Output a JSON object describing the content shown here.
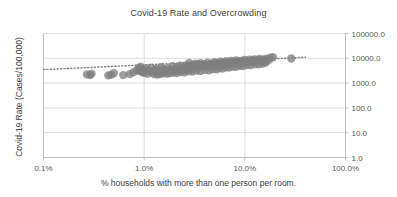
{
  "chart_data": {
    "type": "scatter",
    "title": "Covid-19 Rate and Overcrowding",
    "xlabel": "% households with more than one person per room.",
    "ylabel": "Covid-19 Rate (Cases/100,000)",
    "xscale": "log",
    "yscale": "log",
    "xlim": [
      0.1,
      100.0
    ],
    "ylim": [
      1.0,
      100000.0
    ],
    "x_tick_labels": [
      "0.1%",
      "1.0%",
      "10.0%",
      "100.0%"
    ],
    "x_tick_values": [
      0.1,
      1.0,
      10.0,
      100.0
    ],
    "y_tick_labels": [
      "100000.0",
      "10000.0",
      "1000.0",
      "100.0",
      "10.0",
      "1.0"
    ],
    "y_tick_values": [
      100000.0,
      10000.0,
      1000.0,
      100.0,
      10.0,
      1.0
    ],
    "y_axis_position": "right",
    "grid": "horizontal-and-vertical",
    "legend": "none",
    "marker_color": "#7f7f7f",
    "marker_size": 6,
    "marker_opacity": 0.75,
    "trendline": {
      "style": "dotted",
      "color": "#7f7f7f",
      "x_start": 0.1,
      "y_start": 3500,
      "x_end": 40.0,
      "y_end": 11000
    },
    "series": [
      {
        "name": "Counties",
        "points": [
          [
            0.27,
            2250
          ],
          [
            0.29,
            2100
          ],
          [
            0.3,
            2400
          ],
          [
            0.44,
            2050
          ],
          [
            0.47,
            2150
          ],
          [
            0.5,
            2500
          ],
          [
            0.62,
            2100
          ],
          [
            0.72,
            2300
          ],
          [
            0.78,
            2700
          ],
          [
            0.85,
            3300
          ],
          [
            0.88,
            4000
          ],
          [
            0.9,
            3100
          ],
          [
            0.92,
            4600
          ],
          [
            0.95,
            2800
          ],
          [
            0.97,
            3500
          ],
          [
            1.0,
            2600
          ],
          [
            1.02,
            3000
          ],
          [
            1.05,
            3900
          ],
          [
            1.08,
            2400
          ],
          [
            1.1,
            3200
          ],
          [
            1.15,
            2900
          ],
          [
            1.18,
            4200
          ],
          [
            1.22,
            2700
          ],
          [
            1.28,
            3400
          ],
          [
            1.32,
            3800
          ],
          [
            1.38,
            2500
          ],
          [
            1.42,
            3100
          ],
          [
            1.48,
            4400
          ],
          [
            1.55,
            3600
          ],
          [
            1.6,
            2800
          ],
          [
            1.65,
            3300
          ],
          [
            1.72,
            4000
          ],
          [
            1.78,
            2600
          ],
          [
            1.85,
            3500
          ],
          [
            1.92,
            4800
          ],
          [
            1.98,
            3000
          ],
          [
            2.05,
            3700
          ],
          [
            2.12,
            4300
          ],
          [
            2.2,
            3200
          ],
          [
            2.28,
            5000
          ],
          [
            2.35,
            3900
          ],
          [
            2.45,
            4500
          ],
          [
            2.55,
            3400
          ],
          [
            2.62,
            5200
          ],
          [
            2.7,
            4100
          ],
          [
            2.8,
            6500
          ],
          [
            2.88,
            4700
          ],
          [
            2.95,
            3800
          ],
          [
            3.05,
            5500
          ],
          [
            3.15,
            4300
          ],
          [
            3.25,
            6000
          ],
          [
            3.35,
            4900
          ],
          [
            3.45,
            5600
          ],
          [
            3.55,
            4200
          ],
          [
            3.65,
            6300
          ],
          [
            3.75,
            5100
          ],
          [
            3.85,
            4600
          ],
          [
            3.95,
            5800
          ],
          [
            4.1,
            5000
          ],
          [
            4.25,
            6600
          ],
          [
            4.4,
            5400
          ],
          [
            4.55,
            4800
          ],
          [
            4.7,
            6100
          ],
          [
            4.85,
            5600
          ],
          [
            5.0,
            7000
          ],
          [
            5.15,
            5200
          ],
          [
            5.3,
            6400
          ],
          [
            5.5,
            5900
          ],
          [
            5.7,
            7300
          ],
          [
            5.9,
            5500
          ],
          [
            6.1,
            6800
          ],
          [
            6.3,
            6200
          ],
          [
            6.5,
            7600
          ],
          [
            6.7,
            5800
          ],
          [
            6.9,
            7000
          ],
          [
            7.1,
            6500
          ],
          [
            7.3,
            7900
          ],
          [
            7.5,
            6100
          ],
          [
            7.7,
            7200
          ],
          [
            7.9,
            6700
          ],
          [
            8.2,
            8200
          ],
          [
            8.5,
            6900
          ],
          [
            8.8,
            7600
          ],
          [
            9.1,
            6400
          ],
          [
            9.4,
            8000
          ],
          [
            9.7,
            7200
          ],
          [
            10.0,
            8600
          ],
          [
            10.4,
            7000
          ],
          [
            10.8,
            7800
          ],
          [
            11.2,
            8800
          ],
          [
            11.6,
            7400
          ],
          [
            12.0,
            8300
          ],
          [
            12.5,
            9000
          ],
          [
            13.0,
            7700
          ],
          [
            13.5,
            8600
          ],
          [
            14.0,
            9400
          ],
          [
            14.6,
            8100
          ],
          [
            15.2,
            8900
          ],
          [
            15.8,
            7500
          ],
          [
            16.5,
            9600
          ],
          [
            17.2,
            8400
          ],
          [
            18.0,
            10500
          ],
          [
            19.0,
            11000
          ],
          [
            29.0,
            9800
          ],
          [
            1.25,
            2300
          ],
          [
            1.35,
            2200
          ],
          [
            1.45,
            2350
          ],
          [
            1.55,
            2500
          ],
          [
            1.7,
            2400
          ],
          [
            1.9,
            2600
          ],
          [
            2.1,
            2550
          ],
          [
            2.3,
            2800
          ],
          [
            2.5,
            2700
          ],
          [
            2.75,
            3000
          ],
          [
            3.0,
            2900
          ],
          [
            3.3,
            3200
          ],
          [
            3.6,
            3100
          ],
          [
            4.0,
            3400
          ],
          [
            4.4,
            3300
          ],
          [
            4.8,
            3700
          ],
          [
            5.2,
            3600
          ],
          [
            5.6,
            4000
          ],
          [
            6.0,
            3900
          ],
          [
            6.5,
            4300
          ],
          [
            7.0,
            4200
          ],
          [
            7.6,
            4600
          ],
          [
            8.2,
            4500
          ],
          [
            8.9,
            5000
          ],
          [
            9.6,
            4900
          ],
          [
            10.5,
            5400
          ],
          [
            11.5,
            5300
          ],
          [
            12.6,
            5800
          ],
          [
            13.8,
            5700
          ],
          [
            15.0,
            6200
          ],
          [
            16.0,
            6600
          ]
        ]
      }
    ]
  }
}
